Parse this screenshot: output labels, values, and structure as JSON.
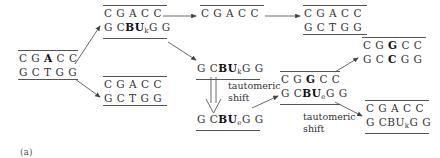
{
  "figure_label": "(a)",
  "duplexes": [
    {
      "id": "start",
      "top": [
        "C",
        "G",
        "A",
        "C",
        "C"
      ],
      "bottom": [
        "G",
        "C",
        "T",
        "G",
        "G"
      ],
      "bold_top": [
        2
      ],
      "bold_bottom": [],
      "rule_top": true,
      "rule_bottom": true
    },
    {
      "id": "bu-incorporated",
      "top": [
        "C",
        "G",
        "A",
        "C",
        "C"
      ],
      "bottom_html": "G CBU_kG G",
      "rule_top": true,
      "rule_bottom": true
    },
    {
      "id": "normal-copy-1",
      "top": [
        "C",
        "G",
        "A",
        "C",
        "C"
      ],
      "bottom": [
        "G",
        "C",
        "T",
        "G",
        "G"
      ],
      "rule_top": true,
      "rule_bottom": false
    },
    {
      "id": "top-strand-only",
      "top": [
        "C",
        "G",
        "A",
        "C",
        "C"
      ],
      "rule_top": true
    },
    {
      "id": "normal-copy-2",
      "top": [
        "C",
        "G",
        "A",
        "C",
        "C"
      ],
      "bottom": [
        "G",
        "C",
        "T",
        "G",
        "G"
      ],
      "rule_top": true,
      "rule_bottom": true
    },
    {
      "id": "bu-keto-strand",
      "bottom_html": "G CBU_kG G",
      "rule_bottom": true
    },
    {
      "id": "bu-enol-strand",
      "bottom_html": "G CBU_eG G",
      "rule_bottom": true
    },
    {
      "id": "mispair-duplex",
      "top": [
        "C",
        "G",
        "G",
        "C",
        "C"
      ],
      "bold_top": [
        2
      ],
      "bottom_html": "G CBU_eG G",
      "rule_top": true,
      "rule_bottom": true
    },
    {
      "id": "mutant-duplex",
      "top": [
        "C",
        "G",
        "G",
        "C",
        "C"
      ],
      "bottom": [
        "G",
        "C",
        "C",
        "G",
        "G"
      ],
      "bold_top": [
        2
      ],
      "bold_bottom": [
        2
      ],
      "rule_top": true,
      "rule_bottom": false
    },
    {
      "id": "reverted-duplex",
      "top": [
        "C",
        "G",
        "A",
        "C",
        "C"
      ],
      "bottom_html": "G CBU_kG G",
      "rule_top": true,
      "rule_bottom": true
    }
  ],
  "text": {
    "start_top": "C G ",
    "start_top_bold": "A",
    "start_top_end": " C C",
    "start_bottom": "G C T G G",
    "cgacc": "C G A C C",
    "gctgg": "G C T G G",
    "g_cbu": "G C",
    "bu": "BU",
    "k": "k",
    "e": "e",
    "gg": "G G",
    "cg": "C G ",
    "g_bold": "G",
    "cc": " C C",
    "gc": "G C ",
    "c_bold": "C",
    "ggend": " G G",
    "tautomeric_shift_1_line1": "tautomeric",
    "tautomeric_shift_1_line2": "shift",
    "tautomeric_shift_2_line1": "tautomeric",
    "tautomeric_shift_2_line2": "shift"
  }
}
